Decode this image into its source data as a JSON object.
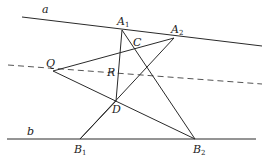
{
  "diagram": {
    "type": "projective-geometry-construction",
    "width": 265,
    "height": 159,
    "stroke_color": "#2a2a2a",
    "dash_color": "#555555",
    "lines": {
      "a": {
        "label": "a",
        "from": [
          22,
          17
        ],
        "to": [
          262,
          46
        ],
        "style": "solid",
        "label_pos": [
          42,
          13
        ]
      },
      "b": {
        "label": "b",
        "from": [
          7,
          139
        ],
        "to": [
          256,
          139
        ],
        "style": "solid",
        "label_pos": [
          27,
          135
        ]
      },
      "dashed": {
        "from": [
          8,
          65
        ],
        "to": [
          262,
          84
        ],
        "style": "dashed"
      }
    },
    "segments": [
      {
        "name": "Q-A2",
        "from": [
          53,
          71
        ],
        "to": [
          174,
          38
        ]
      },
      {
        "name": "Q-B2",
        "from": [
          53,
          71
        ],
        "to": [
          195,
          139
        ]
      },
      {
        "name": "A1-B2",
        "from": [
          122,
          30
        ],
        "to": [
          195,
          139
        ]
      },
      {
        "name": "A2-B1",
        "from": [
          174,
          38
        ],
        "to": [
          80,
          139
        ]
      },
      {
        "name": "A1-D",
        "from": [
          122,
          30
        ],
        "to": [
          116,
          101
        ]
      },
      {
        "name": "D-B1",
        "from": [
          116,
          101
        ],
        "to": [
          80,
          139
        ]
      }
    ],
    "points": [
      {
        "name": "A1",
        "base": "A",
        "sub": "1",
        "at": [
          122,
          30
        ],
        "label_pos": [
          117,
          25
        ]
      },
      {
        "name": "A2",
        "base": "A",
        "sub": "2",
        "at": [
          174,
          38
        ],
        "label_pos": [
          171,
          33
        ]
      },
      {
        "name": "C",
        "base": "C",
        "sub": "",
        "at": [
          134,
          50
        ],
        "label_pos": [
          133,
          46
        ]
      },
      {
        "name": "Q",
        "base": "Q",
        "sub": "",
        "at": [
          53,
          71
        ],
        "label_pos": [
          46,
          67
        ]
      },
      {
        "name": "R",
        "base": "R",
        "sub": "",
        "at": [
          117,
          77
        ],
        "label_pos": [
          107,
          76
        ]
      },
      {
        "name": "D",
        "base": "D",
        "sub": "",
        "at": [
          116,
          101
        ],
        "label_pos": [
          112,
          113
        ]
      },
      {
        "name": "B1",
        "base": "B",
        "sub": "1",
        "at": [
          80,
          139
        ],
        "label_pos": [
          74,
          153
        ]
      },
      {
        "name": "B2",
        "base": "B",
        "sub": "2",
        "at": [
          195,
          139
        ],
        "label_pos": [
          193,
          153
        ]
      }
    ]
  }
}
